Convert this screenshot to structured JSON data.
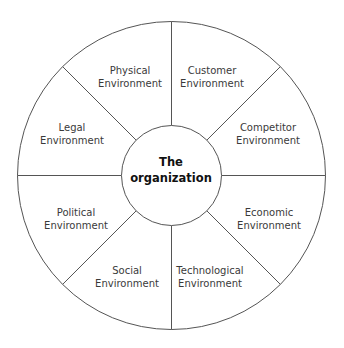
{
  "diagram": {
    "center": {
      "line1": "The",
      "line2": "organization"
    },
    "segments": [
      {
        "line1": "Physical",
        "line2": "Environment"
      },
      {
        "line1": "Customer",
        "line2": "Environment"
      },
      {
        "line1": "Competitor",
        "line2": "Environment"
      },
      {
        "line1": "Economic",
        "line2": "Environment"
      },
      {
        "line1": "Technological",
        "line2": "Environment"
      },
      {
        "line1": "Social",
        "line2": "Environment"
      },
      {
        "line1": "Political",
        "line2": "Environment"
      },
      {
        "line1": "Legal",
        "line2": "Environment"
      }
    ],
    "colors": {
      "stroke": "#555555",
      "text": "#3a3a3a",
      "background": "#ffffff"
    }
  }
}
